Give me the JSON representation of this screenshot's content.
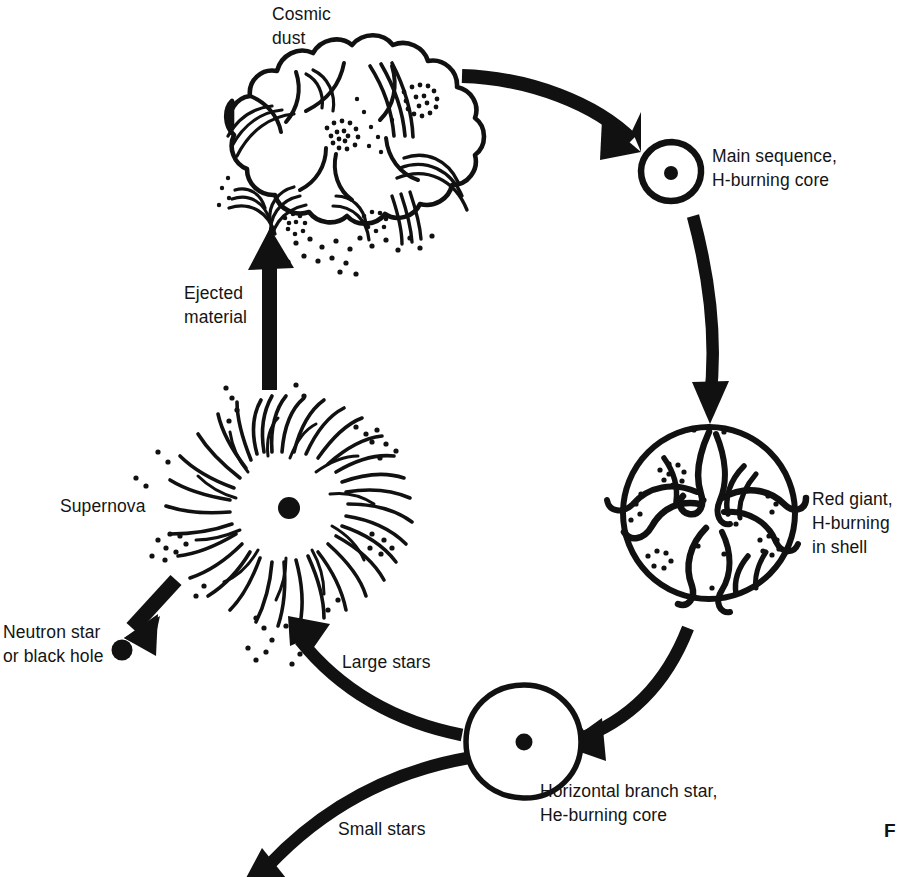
{
  "figure": {
    "partial_caption_mark": "F",
    "background_color": "#ffffff",
    "ink_color": "#111111"
  },
  "labels": {
    "cosmic_dust": "Cosmic\ndust",
    "main_sequence": "Main sequence,\nH-burning core",
    "red_giant": "Red giant,\nH-burning\nin shell",
    "horizontal_branch": "Horizontal branch star,\nHe-burning core",
    "ejected_material": "Ejected\nmaterial",
    "supernova": "Supernova",
    "neutron_star": "Neutron star\nor black hole",
    "large_stars": "Large stars",
    "small_stars": "Small stars"
  },
  "nodes": [
    {
      "id": "cosmic-dust",
      "name": "Cosmic dust",
      "shape": "billowy-cloud"
    },
    {
      "id": "main-sequence",
      "name": "Main sequence, H-burning core",
      "shape": "circle-with-core-dot"
    },
    {
      "id": "red-giant",
      "name": "Red giant, H-burning in shell",
      "shape": "large-circle-convective-swirls"
    },
    {
      "id": "horizontal-branch",
      "name": "Horizontal branch star, He-burning core",
      "shape": "circle-with-core-dot"
    },
    {
      "id": "supernova",
      "name": "Supernova",
      "shape": "radial-burst-with-core-dot"
    },
    {
      "id": "neutron-star",
      "name": "Neutron star or black hole",
      "shape": "solid-dot"
    }
  ],
  "arrows": [
    {
      "id": "dust-to-main-sequence",
      "from": "Cosmic dust",
      "to": "Main sequence",
      "style": "thick-curved"
    },
    {
      "id": "main-sequence-to-red-giant",
      "from": "Main sequence",
      "to": "Red giant",
      "style": "thick-curved-vertical"
    },
    {
      "id": "red-giant-to-horizontal",
      "from": "Red giant",
      "to": "Horizontal branch star",
      "style": "thick-curved"
    },
    {
      "id": "horizontal-to-supernova",
      "from": "Horizontal branch star",
      "to": "Supernova",
      "style": "thick-curved",
      "branch_label": "Large stars"
    },
    {
      "id": "horizontal-to-small-stars",
      "from": "Horizontal branch star",
      "to": "off-page bottom",
      "style": "thick-curved",
      "branch_label": "Small stars"
    },
    {
      "id": "supernova-to-cosmic-dust",
      "from": "Supernova",
      "to": "Cosmic dust",
      "style": "thick-straight-vertical",
      "branch_label": "Ejected material"
    },
    {
      "id": "supernova-to-neutron-star",
      "from": "Supernova",
      "to": "Neutron star or black hole",
      "style": "thick-straight-diagonal"
    }
  ]
}
